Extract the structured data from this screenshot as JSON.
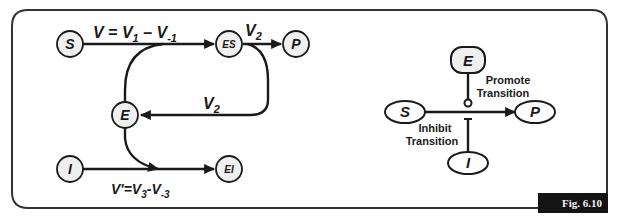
{
  "figure_label": "Fig. 6.10",
  "left_diagram": {
    "nodes": {
      "S": "S",
      "ES": "ES",
      "P": "P",
      "E": "E",
      "I": "I",
      "EI": "EI"
    },
    "labels": {
      "v_top": "V = V",
      "v_top_sub1": "1",
      "v_top_minus": " – V",
      "v_top_sub2": "-1",
      "v2_top": "V",
      "v2_top_sub": "2",
      "v2_mid": "V",
      "v2_mid_sub": "2",
      "vprime": "V'=V",
      "vprime_sub1": "3",
      "vprime_minus": "-V",
      "vprime_sub2": "-3"
    }
  },
  "right_diagram": {
    "nodes": {
      "E": "E",
      "S": "S",
      "P": "P",
      "I": "I"
    },
    "labels": {
      "promote_line1": "Promote",
      "promote_line2": "Transition",
      "inhibit_line1": "Inhibit",
      "inhibit_line2": "Transition"
    }
  },
  "colors": {
    "stroke": "#1a1a1a",
    "node_fill": "#efefef",
    "frame": "#333333",
    "badge_bg": "#141414",
    "badge_text": "#f2f2f2"
  }
}
